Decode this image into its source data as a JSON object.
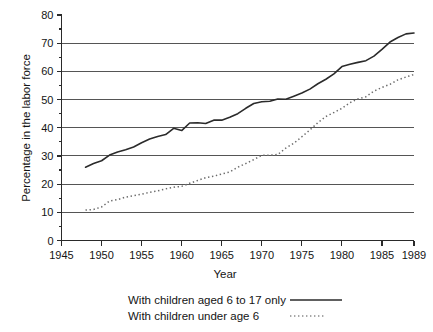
{
  "chart_data": {
    "type": "line",
    "title": "",
    "xlabel": "Year",
    "ylabel": "Percentage in the labor force",
    "xlim": [
      1945,
      1989
    ],
    "ylim": [
      0,
      80
    ],
    "grid": true,
    "grid_axis": "y",
    "legend_position": "below",
    "x_ticks": [
      1945,
      1950,
      1955,
      1960,
      1965,
      1970,
      1975,
      1980,
      1985,
      1989
    ],
    "x_tick_labels": [
      "1945",
      "1950",
      "1955",
      "1960",
      "1965",
      "1970",
      "1975",
      "1980",
      "1985",
      "1989"
    ],
    "y_ticks": [
      0,
      10,
      20,
      30,
      40,
      50,
      60,
      70,
      80
    ],
    "y_tick_labels": [
      "0",
      "10",
      "20",
      "30",
      "40",
      "50",
      "60",
      "70",
      "80"
    ],
    "series": [
      {
        "name": "With children aged 6 to 17 only",
        "style": "solid",
        "color": "#2b2b2b",
        "x": [
          1948,
          1949,
          1950,
          1951,
          1952,
          1953,
          1954,
          1955,
          1956,
          1957,
          1958,
          1959,
          1960,
          1961,
          1962,
          1963,
          1964,
          1965,
          1966,
          1967,
          1968,
          1969,
          1970,
          1971,
          1972,
          1973,
          1974,
          1975,
          1976,
          1977,
          1978,
          1979,
          1980,
          1981,
          1982,
          1983,
          1984,
          1985,
          1986,
          1987,
          1988,
          1989
        ],
        "values": [
          26.0,
          27.3,
          28.3,
          30.3,
          31.4,
          32.2,
          33.2,
          34.7,
          36.0,
          36.9,
          37.6,
          39.8,
          39.0,
          41.7,
          41.8,
          41.5,
          42.7,
          42.7,
          43.7,
          45.0,
          46.9,
          48.6,
          49.2,
          49.4,
          50.2,
          50.1,
          51.2,
          52.3,
          53.7,
          55.6,
          57.2,
          59.1,
          61.7,
          62.5,
          63.2,
          63.8,
          65.4,
          67.8,
          70.4,
          72.0,
          73.3,
          73.6
        ]
      },
      {
        "name": "With children under age 6",
        "style": "dotted",
        "color": "#6b6b6b",
        "x": [
          1948,
          1949,
          1950,
          1951,
          1952,
          1953,
          1954,
          1955,
          1956,
          1957,
          1958,
          1959,
          1960,
          1961,
          1962,
          1963,
          1964,
          1965,
          1966,
          1967,
          1968,
          1969,
          1970,
          1971,
          1972,
          1973,
          1974,
          1975,
          1976,
          1977,
          1978,
          1979,
          1980,
          1981,
          1982,
          1983,
          1984,
          1985,
          1986,
          1987,
          1988,
          1989
        ],
        "values": [
          10.8,
          11.0,
          11.9,
          14.0,
          14.5,
          15.4,
          15.9,
          16.4,
          17.1,
          17.6,
          18.3,
          18.9,
          19.2,
          20.3,
          21.3,
          22.3,
          22.8,
          23.6,
          24.3,
          26.0,
          27.3,
          28.7,
          30.2,
          30.3,
          30.5,
          32.8,
          34.5,
          36.8,
          39.2,
          41.8,
          44.0,
          45.4,
          46.9,
          48.9,
          50.2,
          51.0,
          53.0,
          54.3,
          55.4,
          57.0,
          58.0,
          58.9
        ]
      }
    ]
  },
  "axes": {
    "y_title": "Percentage in the labor force",
    "x_title": "Year"
  },
  "legend": {
    "entries": [
      {
        "label": "With children aged 6 to 17 only",
        "style": "solid"
      },
      {
        "label": "With children under age 6",
        "style": "dotted"
      }
    ]
  }
}
